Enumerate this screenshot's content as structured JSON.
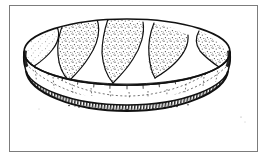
{
  "page": {
    "background_color": "#ffffff",
    "width": 269,
    "height": 159,
    "alt_text": "Line drawing of an oval disc-shaped woven basket seen in perspective"
  },
  "frame": {
    "border_color": "#7c7c7c",
    "border_width": 1,
    "fill_color": "#ffffff",
    "x": 9,
    "y": 5,
    "width": 249,
    "height": 147
  },
  "illustration": {
    "title": "",
    "subject": "oval disc object",
    "style": "pen-and-ink stipple line drawing",
    "ink_color": "#111111",
    "stipple_color": "#4a4a4a",
    "bounds": {
      "x": 24,
      "y": 19,
      "width": 207,
      "height": 107
    },
    "top_face": {
      "name": "top-surface",
      "center_x": 127,
      "center_y": 52,
      "radius_x": 103,
      "radius_y": 33,
      "fill": "#ffffff",
      "stipple_regions": 5,
      "divider_bands": 5
    },
    "side_band": {
      "name": "side-wall",
      "depth": 40,
      "pattern": "dashed net grid",
      "grid_columns": 11,
      "grid_rows": 2,
      "bottom_edge_style": "dark hatched band"
    },
    "labels": []
  }
}
